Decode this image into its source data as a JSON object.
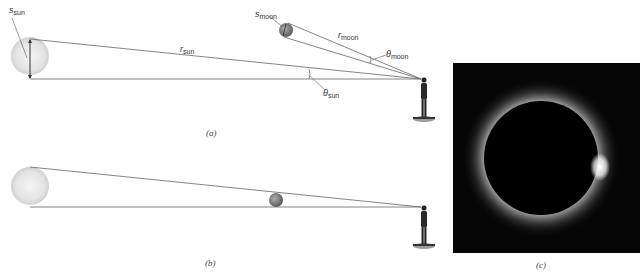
{
  "figure": {
    "panel_a": {
      "caption": "(a)",
      "labels": {
        "s_sun": {
          "main": "s",
          "sub": "sun"
        },
        "r_sun": {
          "main": "r",
          "sub": "sun"
        },
        "theta_sun": {
          "main": "θ",
          "sub": "sun"
        },
        "s_moon": {
          "main": "s",
          "sub": "moon"
        },
        "r_moon": {
          "main": "r",
          "sub": "moon"
        },
        "theta_moon": {
          "main": "θ",
          "sub": "moon"
        }
      }
    },
    "panel_b": {
      "caption": "(b)"
    },
    "panel_c": {
      "caption": "(c)"
    }
  },
  "colors": {
    "line": "#555555",
    "sun_fill": "#e6e6e6",
    "moon_fill": "#8a8a8a",
    "photo_bg": "#050505"
  }
}
